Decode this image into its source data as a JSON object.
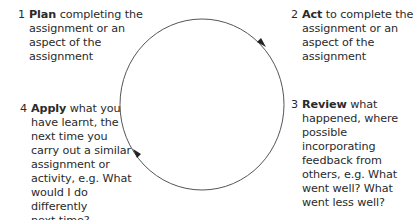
{
  "diagram": {
    "type": "cycle",
    "direction": "clockwise",
    "line_color": "#555555",
    "arrow_color": "#222222",
    "steps": [
      {
        "number": "1",
        "keyword": "Plan",
        "lines": [
          "completing the",
          "assignment or an",
          "aspect of the",
          "assignment"
        ]
      },
      {
        "number": "2",
        "keyword": "Act",
        "lines": [
          "to complete the",
          "assignment or an",
          "aspect of the",
          "assignment"
        ]
      },
      {
        "number": "3",
        "keyword": "Review",
        "lines": [
          "what",
          "happened, where",
          "possible",
          "incorporating",
          "feedback from",
          "others, e.g. What",
          "went well? What",
          "went less well?"
        ]
      },
      {
        "number": "4",
        "keyword": "Apply",
        "lines": [
          "what you",
          "have learnt, the",
          "next time you",
          "carry out a similar",
          "assignment or",
          "activity, e.g. What",
          "would I do differently",
          "next time?"
        ]
      }
    ]
  }
}
